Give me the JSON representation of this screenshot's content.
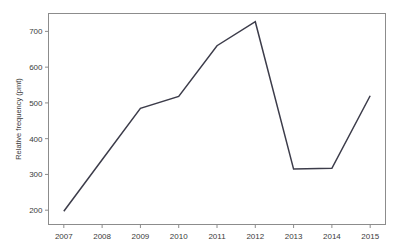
{
  "chart_data": {
    "type": "line",
    "title": "",
    "xlabel": "",
    "ylabel": "Relative frequency (pmt)",
    "categories": [
      "2007",
      "2008",
      "2009",
      "2010",
      "2011",
      "2012",
      "2013",
      "2014",
      "2015"
    ],
    "x": [
      2007,
      2008,
      2009,
      2010,
      2011,
      2012,
      2013,
      2014,
      2015
    ],
    "values": [
      197,
      341,
      485,
      518,
      660,
      727,
      315,
      317,
      520
    ],
    "series": [
      {
        "name": "Relative frequency (pmt)",
        "values": [
          197,
          341,
          485,
          518,
          660,
          727,
          315,
          317,
          520
        ]
      }
    ],
    "xtick_labels": [
      "2007",
      "2008",
      "2009",
      "2010",
      "2011",
      "2012",
      "2013",
      "2014",
      "2015"
    ],
    "ytick_labels": [
      "200",
      "300",
      "400",
      "500",
      "600",
      "700"
    ],
    "ytick_values": [
      200,
      300,
      400,
      500,
      600,
      700
    ],
    "ylim": [
      160,
      750
    ],
    "xlim": [
      2006.6,
      2015.4
    ],
    "grid": false,
    "legend": null,
    "line_color": "#3c3c4a",
    "axis_color": "#8c8c8c",
    "background_color": "#ffffff"
  }
}
